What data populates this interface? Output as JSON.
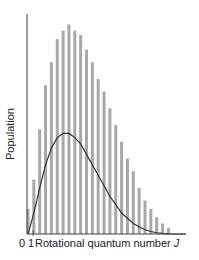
{
  "chart_data": {
    "type": "bar",
    "title": "",
    "xlabel": "Rotational quantum number J",
    "xlabel_text": "Rotational quantum number",
    "xlabel_var": "J",
    "ylabel": "Population",
    "x_tick_labels": [
      "0",
      "1"
    ],
    "grid": false,
    "legend": null,
    "colors": {
      "bars": "#a8a8a8",
      "curve": "#333333",
      "axis": "#444444"
    },
    "categories": [
      0,
      1,
      2,
      3,
      4,
      5,
      6,
      7,
      8,
      9,
      10,
      11,
      12,
      13,
      14,
      15,
      16,
      17,
      18,
      19,
      20,
      21,
      22,
      23,
      24
    ],
    "series": [
      {
        "name": "Population (degeneracy-weighted, bars)",
        "type": "bar",
        "values": [
          0.12,
          0.26,
          0.5,
          0.71,
          0.82,
          0.93,
          0.97,
          1.0,
          0.97,
          0.95,
          0.88,
          0.82,
          0.74,
          0.68,
          0.6,
          0.52,
          0.44,
          0.36,
          0.3,
          0.22,
          0.16,
          0.12,
          0.08,
          0.05,
          0.03
        ]
      },
      {
        "name": "Boltzmann distribution (curve)",
        "type": "line",
        "values": [
          0.0,
          0.1,
          0.22,
          0.33,
          0.41,
          0.46,
          0.48,
          0.48,
          0.46,
          0.43,
          0.38,
          0.33,
          0.28,
          0.23,
          0.18,
          0.14,
          0.1,
          0.075,
          0.05,
          0.035,
          0.02,
          0.012,
          0.006,
          0.003,
          0.001
        ]
      }
    ],
    "ylim": [
      0,
      1.05
    ]
  }
}
